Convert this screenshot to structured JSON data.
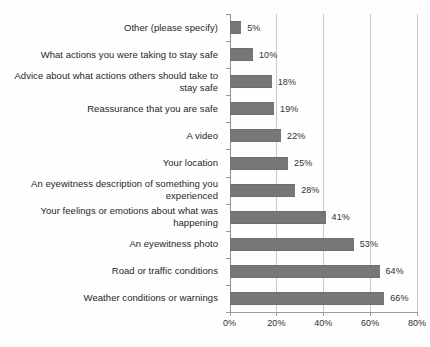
{
  "chart_data": {
    "type": "bar",
    "orientation": "horizontal",
    "title": "",
    "subtitle": "",
    "xlabel": "",
    "ylabel": "",
    "xlim": [
      0,
      80
    ],
    "xticks": [
      0,
      20,
      40,
      60,
      80
    ],
    "xtick_labels": [
      "0%",
      "20%",
      "40%",
      "60%",
      "80%"
    ],
    "grid": true,
    "grid_axis": "x",
    "legend": false,
    "legend_position": "none",
    "value_label_suffix": "%",
    "bar_color": "#777777",
    "gridline_color": "#c9c9c9",
    "axis_color": "#9a9a9a",
    "text_color": "#262626",
    "background_color": "#fefefe",
    "categories": [
      "Other (please specify)",
      "What actions you were taking to stay safe",
      "Advice about what actions others should take to stay safe",
      "Reassurance that you are safe",
      "A video",
      "Your location",
      "An eyewitness description of something you experienced",
      "Your feelings or emotions about what was happening",
      "An eyewitness photo",
      "Road or traffic conditions",
      "Weather conditions or warnings"
    ],
    "values": [
      5,
      10,
      18,
      19,
      22,
      25,
      28,
      41,
      53,
      64,
      66
    ],
    "value_labels": [
      "5%",
      "10%",
      "18%",
      "19%",
      "22%",
      "25%",
      "28%",
      "41%",
      "53%",
      "64%",
      "66%"
    ]
  }
}
